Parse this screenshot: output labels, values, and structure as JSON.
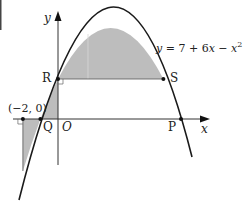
{
  "diagram": {
    "equation": {
      "lhs": "y",
      "rhs_text": " = 7 + 6",
      "x_var": "x",
      "minus": " − ",
      "x_sq": "x",
      "exp": "2"
    },
    "axes": {
      "x_label": "x",
      "y_label": "y",
      "origin_label": "O"
    },
    "points": {
      "R": "R",
      "S": "S",
      "Q": "Q",
      "P": "P",
      "neg_two": "(−2, 0)"
    },
    "colors": {
      "shade": "#bdbdbd",
      "curve": "#1a1a1a",
      "axis": "#333333",
      "guide": "#d8d8d8"
    },
    "math": {
      "function": "y = 7 + 6x - x^2",
      "roots": [
        -1,
        7
      ],
      "vertex": [
        3,
        16
      ],
      "R": [
        0,
        7
      ],
      "S": [
        6,
        7
      ],
      "Q": [
        -1,
        0
      ],
      "P": [
        7,
        0
      ],
      "marked_point": [
        -2,
        0
      ]
    }
  }
}
